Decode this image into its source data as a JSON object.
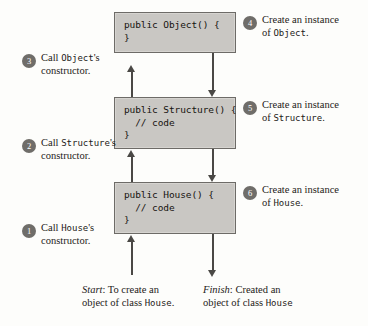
{
  "diagram": {
    "boxes": [
      {
        "id": "object",
        "code": "public Object() {\n}"
      },
      {
        "id": "structure",
        "code": "public Structure() {\n  // code\n}"
      },
      {
        "id": "house",
        "code": "public House() {\n  // code\n}"
      }
    ],
    "left_callouts": [
      {
        "number": "3",
        "line1_pre": "Call ",
        "line1_mono": "Object",
        "line1_post": "'s",
        "line2": "constructor."
      },
      {
        "number": "2",
        "line1_pre": "Call ",
        "line1_mono": "Structure",
        "line1_post": "'s",
        "line2": "constructor."
      },
      {
        "number": "1",
        "line1_pre": "Call ",
        "line1_mono": "House",
        "line1_post": "'s",
        "line2": "constructor."
      }
    ],
    "right_callouts": [
      {
        "number": "4",
        "line1": "Create an instance",
        "line2_pre": "of ",
        "line2_mono": "Object",
        "line2_post": "."
      },
      {
        "number": "5",
        "line1": "Create an instance",
        "line2_pre": "of ",
        "line2_mono": "Structure",
        "line2_post": "."
      },
      {
        "number": "6",
        "line1": "Create an instance",
        "line2_pre": "of ",
        "line2_mono": "House",
        "line2_post": "."
      }
    ],
    "captions": [
      {
        "id": "start",
        "label": "Start",
        "line1_post": ": To create an",
        "line2_pre": "object of class ",
        "line2_mono": "House",
        "line2_post": "."
      },
      {
        "id": "finish",
        "label": "Finish",
        "line1_post": ": Created an",
        "line2_pre": "object of class ",
        "line2_mono": "House",
        "line2_post": ""
      }
    ],
    "colors": {
      "box_fill": "#c9c7c3",
      "box_border": "#6d6b67",
      "badge_fill": "#6f6d69",
      "arrow": "#4a4845",
      "text": "#1d1b18"
    }
  }
}
